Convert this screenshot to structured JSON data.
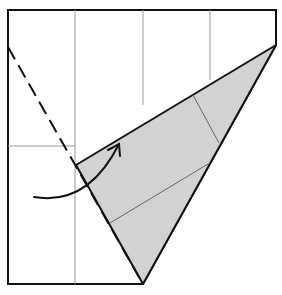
{
  "diagram": {
    "colors": {
      "paper": "#ffffff",
      "flap": "#d2d2d2",
      "outline": "#111111",
      "crease": "#777777",
      "grid": "#999999"
    },
    "paper_outline": [
      [
        8,
        10
      ],
      [
        276,
        10
      ],
      [
        276,
        45
      ],
      [
        143,
        284
      ],
      [
        8,
        284
      ]
    ],
    "grid_lines": [
      {
        "x1": 75,
        "y1": 10,
        "x2": 75,
        "y2": 284
      },
      {
        "x1": 143,
        "y1": 10,
        "x2": 143,
        "y2": 105
      },
      {
        "x1": 210,
        "y1": 10,
        "x2": 210,
        "y2": 80
      },
      {
        "x1": 8,
        "y1": 146,
        "x2": 75,
        "y2": 146
      }
    ],
    "flap_polygon": [
      [
        276,
        45
      ],
      [
        76,
        165
      ],
      [
        143,
        284
      ]
    ],
    "flap_creases": [
      {
        "x1": 193,
        "y1": 95,
        "x2": 219,
        "y2": 143
      },
      {
        "x1": 110,
        "y1": 223,
        "x2": 208,
        "y2": 164
      }
    ],
    "valley_fold_line": {
      "x1": 8,
      "y1": 47,
      "x2": 143,
      "y2": 284
    },
    "arrow": {
      "path": "M34,197 Q85,205 118,144",
      "head": "118,144"
    },
    "caption": "Valley fold the left corner up along the dashed line"
  }
}
